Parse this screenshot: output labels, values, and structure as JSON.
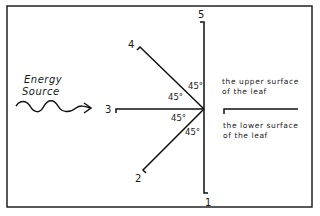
{
  "energy_source": {
    "line1": "Energy",
    "line2": "Source"
  },
  "positions": {
    "p1": "1",
    "p2": "2",
    "p3": "3",
    "p4": "4",
    "p5": "5"
  },
  "angles": {
    "a1": "45°",
    "a2": "45°",
    "a3": "45°",
    "a4": "45°"
  },
  "upper_surface": {
    "line1": "the upper surface",
    "line2": "of the leaf"
  },
  "lower_surface": {
    "line1": "the lower surface",
    "line2": "of the leaf"
  },
  "colors": {
    "ink": "#111111",
    "background": "#ffffff"
  }
}
